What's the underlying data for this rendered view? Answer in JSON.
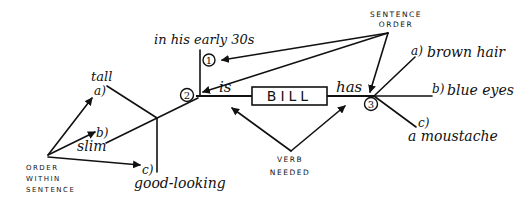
{
  "diagram": {
    "subject": "BILL",
    "verbs": {
      "is": "is",
      "has": "has"
    },
    "nodes": {
      "n1": "1",
      "n2": "2",
      "n3": "3"
    },
    "is_branch": {
      "time_phrase": "in his early 30s",
      "items": [
        {
          "letter": "a)",
          "text": "tall"
        },
        {
          "letter": "b)",
          "text": "slim"
        },
        {
          "letter": "c)",
          "text": "good-looking"
        }
      ]
    },
    "has_branch": {
      "items": [
        {
          "letter": "a)",
          "text": "brown hair"
        },
        {
          "letter": "b)",
          "text": "blue eyes"
        },
        {
          "letter": "c)",
          "text": "a moustache"
        }
      ]
    },
    "annotations": {
      "sentence_order_line1": "SENTENCE",
      "sentence_order_line2": "ORDER",
      "verb_needed_line1": "VERB",
      "verb_needed_line2": "NEEDED",
      "order_within_line1": "ORDER",
      "order_within_line2": "WITHIN",
      "order_within_line3": "SENTENCE"
    },
    "colors": {
      "ink": "#111111",
      "background": "#ffffff"
    }
  }
}
